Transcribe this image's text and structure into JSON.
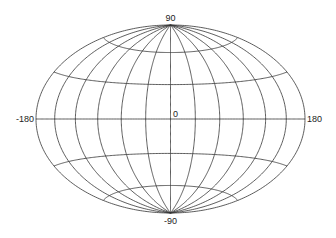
{
  "map": {
    "projection": "Hammer",
    "graticule": {
      "meridian_step_deg": 30,
      "parallel_step_deg": 30,
      "line_color": "#333333",
      "background": "#ffffff"
    },
    "labels": {
      "north": "90",
      "south": "-90",
      "west": "-180",
      "east": "180",
      "center": "0"
    },
    "geometry": {
      "center_x": 170.5,
      "center_y": 119,
      "semi_major_px": 134.5,
      "semi_minor_px": 94
    }
  }
}
